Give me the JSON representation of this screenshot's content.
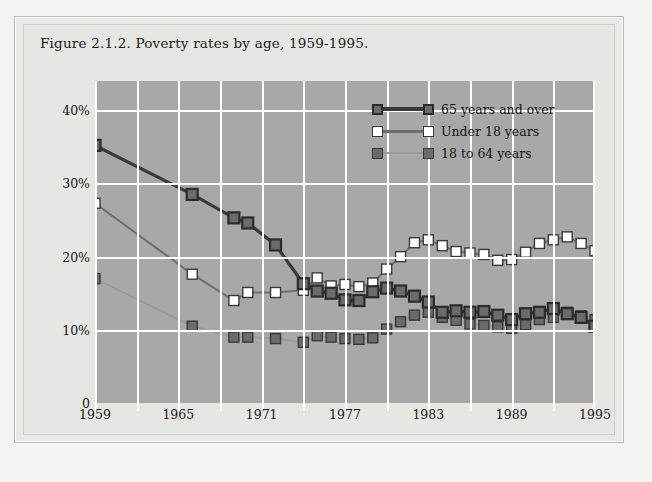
{
  "figure": {
    "title": "Figure 2.1.2. Poverty rates by age, 1959-1995."
  },
  "colors": {
    "page_background": "#f3f3f1",
    "panel_background": "#e6e6e3",
    "plot_background": "#a8a8a8",
    "gridline": "#ffffff",
    "series_65_plus": "#3a3a3a",
    "series_under_18": "#ffffff",
    "series_18_to_64": "#6e6e6e",
    "marker_edge": "#2b2b2b",
    "text": "#1b1b1b"
  },
  "legend": {
    "position": "inside-top-right",
    "entries": [
      {
        "label": "65 years and over",
        "line_color": "#3a3a3a",
        "marker_fill": "#6b6b6b",
        "marker_edge": "#2b2b2b"
      },
      {
        "label": "Under 18 years",
        "line_color": "#6e6e6e",
        "marker_fill": "#ffffff",
        "marker_edge": "#3a3a3a"
      },
      {
        "label": "18 to 64 years",
        "line_color": "#9a9a9a",
        "marker_fill": "#6b6b6b",
        "marker_edge": "#3a3a3a"
      }
    ]
  },
  "chart_data": {
    "type": "line",
    "title": "Figure 2.1.2. Poverty rates by age, 1959-1995.",
    "xlabel": "",
    "ylabel": "",
    "xlim": [
      1959,
      1995
    ],
    "ylim": [
      0,
      44
    ],
    "grid": true,
    "grid_x_interval": 3,
    "y_ticks": [
      0,
      10,
      20,
      30,
      40
    ],
    "y_tick_labels": [
      "0",
      "10%",
      "20%",
      "30%",
      "40%"
    ],
    "x_ticks": [
      1959,
      1965,
      1971,
      1977,
      1983,
      1989,
      1995
    ],
    "x_tick_labels": [
      "1959",
      "1965",
      "1971",
      "1977",
      "1983",
      "1989",
      "1995"
    ],
    "x_minor_interval": 3,
    "series": [
      {
        "name": "65 years and over",
        "color": "#3a3a3a",
        "marker": "square",
        "x": [
          1959,
          1966,
          1969,
          1970,
          1972,
          1974,
          1975,
          1976,
          1977,
          1978,
          1979,
          1980,
          1981,
          1982,
          1983,
          1984,
          1985,
          1986,
          1987,
          1988,
          1989,
          1990,
          1991,
          1992,
          1993,
          1994,
          1995
        ],
        "values": [
          35.2,
          28.5,
          25.3,
          24.6,
          21.6,
          16.3,
          15.3,
          15.0,
          14.1,
          14.0,
          15.2,
          15.7,
          15.3,
          14.6,
          13.8,
          12.4,
          12.6,
          12.4,
          12.5,
          12.0,
          11.4,
          12.2,
          12.4,
          12.9,
          12.2,
          11.7,
          10.5
        ],
        "note": "approximate values read from gridlines"
      },
      {
        "name": "Under 18 years",
        "color": "#6e6e6e",
        "marker": "square",
        "x": [
          1959,
          1966,
          1969,
          1970,
          1972,
          1974,
          1975,
          1976,
          1977,
          1978,
          1979,
          1980,
          1981,
          1982,
          1983,
          1984,
          1985,
          1986,
          1987,
          1988,
          1989,
          1990,
          1991,
          1992,
          1993,
          1994,
          1995
        ],
        "values": [
          27.3,
          17.6,
          14.0,
          15.1,
          15.1,
          15.4,
          17.1,
          16.0,
          16.2,
          15.9,
          16.4,
          18.3,
          20.0,
          21.9,
          22.3,
          21.5,
          20.7,
          20.5,
          20.3,
          19.5,
          19.6,
          20.6,
          21.8,
          22.3,
          22.7,
          21.8,
          20.8
        ]
      },
      {
        "name": "18 to 64 years",
        "color": "#9a9a9a",
        "marker": "square",
        "x": [
          1959,
          1966,
          1969,
          1970,
          1972,
          1974,
          1975,
          1976,
          1977,
          1978,
          1979,
          1980,
          1981,
          1982,
          1983,
          1984,
          1985,
          1986,
          1987,
          1988,
          1989,
          1990,
          1991,
          1992,
          1993,
          1994,
          1995
        ],
        "values": [
          17.0,
          10.5,
          9.0,
          9.0,
          8.8,
          8.3,
          9.2,
          9.0,
          8.8,
          8.7,
          8.9,
          10.1,
          11.1,
          12.0,
          12.4,
          11.7,
          11.3,
          10.8,
          10.6,
          10.4,
          10.2,
          10.7,
          11.4,
          11.7,
          12.4,
          11.9,
          11.4
        ]
      }
    ]
  }
}
